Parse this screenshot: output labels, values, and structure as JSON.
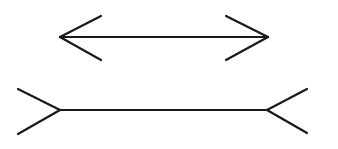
{
  "figure": {
    "title": "Müller-Lyer illusion",
    "background": "#ffffff",
    "stroke_color": "#1a1a1a",
    "stroke_width": 2.2,
    "figures": [
      {
        "name": "arrows-inward-line",
        "label": "Line with outward-pointing arrowheads",
        "shaft": [
          60,
          37,
          268,
          37
        ],
        "fins": [
          [
            60,
            37,
            101,
            16
          ],
          [
            60,
            37,
            101,
            60
          ],
          [
            268,
            37,
            226,
            16
          ],
          [
            268,
            37,
            226,
            60
          ]
        ]
      },
      {
        "name": "arrows-outward-line",
        "label": "Line with inward-pointing fins",
        "shaft": [
          60,
          110,
          267,
          110
        ],
        "fins": [
          [
            60,
            110,
            18,
            89
          ],
          [
            60,
            110,
            18,
            134
          ],
          [
            267,
            110,
            307,
            89
          ],
          [
            267,
            110,
            307,
            133
          ]
        ]
      }
    ]
  }
}
